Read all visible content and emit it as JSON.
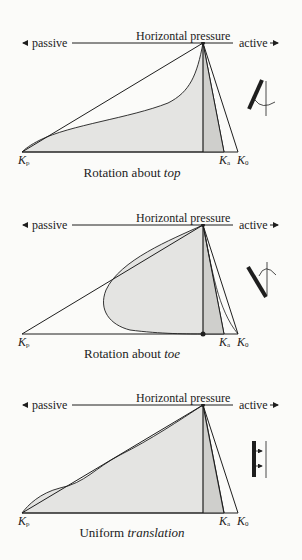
{
  "colors": {
    "ink": "#1e1e1e",
    "fill_light": "#e4e4e2",
    "fill_dark": "#cfcfcc",
    "background": "#fbfbf9"
  },
  "panels": [
    {
      "id": "top",
      "axis": {
        "passive": "passive",
        "title": "Horizontal pressure",
        "active": "active"
      },
      "labels": {
        "kp": "K",
        "kp_sub": "p",
        "ka": "K",
        "ka_sub": "a",
        "k0": "K",
        "k0_sub": "0"
      },
      "caption_prefix": "Rotation about ",
      "caption_italic": "top",
      "wall_icon": "rotation-about-top-wall-icon",
      "geom": {
        "axis_y": 43,
        "base_y": 152,
        "apex_x": 203,
        "kp_x": 22,
        "ka_x": 224,
        "k0_x": 238
      }
    },
    {
      "id": "toe",
      "axis": {
        "passive": "passive",
        "title": "Horizontal pressure",
        "active": "active"
      },
      "labels": {
        "kp": "K",
        "kp_sub": "p",
        "ka": "K",
        "ka_sub": "a",
        "k0": "K",
        "k0_sub": "0"
      },
      "caption_prefix": "Rotation about ",
      "caption_italic": "toe",
      "wall_icon": "rotation-about-toe-wall-icon",
      "geom": {
        "axis_y": 225,
        "base_y": 334,
        "apex_x": 203,
        "kp_x": 22,
        "ka_x": 224,
        "k0_x": 238
      }
    },
    {
      "id": "translation",
      "axis": {
        "passive": "passive",
        "title": "Horizontal pressure",
        "active": "active"
      },
      "labels": {
        "kp": "K",
        "kp_sub": "p",
        "ka": "K",
        "ka_sub": "a",
        "k0": "K",
        "k0_sub": "0"
      },
      "caption_prefix": "Uniform ",
      "caption_italic": "translation",
      "wall_icon": "uniform-translation-wall-icon",
      "geom": {
        "axis_y": 405,
        "base_y": 513,
        "apex_x": 203,
        "kp_x": 22,
        "ka_x": 224,
        "k0_x": 238
      }
    }
  ]
}
